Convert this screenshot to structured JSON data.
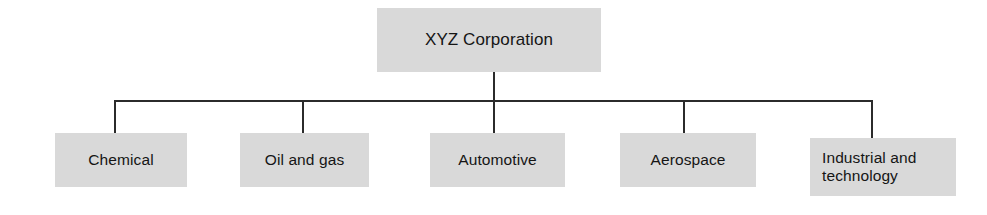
{
  "chart": {
    "type": "organization-chart",
    "orientation": "top-down",
    "levels": 2,
    "colors": {
      "node_fill": "#d9d9d9",
      "node_shadow": "#b4b4b4",
      "connector": "#2b2b2b",
      "text": "#151515",
      "background": "#ffffff"
    },
    "root": {
      "label": "XYZ Corporation"
    },
    "children": [
      {
        "label": "Chemical"
      },
      {
        "label": "Oil and gas"
      },
      {
        "label": "Automotive"
      },
      {
        "label": "Aerospace"
      },
      {
        "label": "Industrial and\ntechnology"
      }
    ]
  }
}
